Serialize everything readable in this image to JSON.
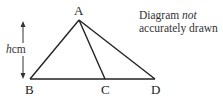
{
  "diagram": {
    "points": {
      "A": {
        "label": "A",
        "x": 79,
        "y": 20
      },
      "B": {
        "label": "B",
        "x": 30,
        "y": 79
      },
      "C": {
        "label": "C",
        "x": 105,
        "y": 79
      },
      "D": {
        "label": "D",
        "x": 155,
        "y": 79
      }
    },
    "segments": [
      "AB",
      "AC",
      "AD",
      "BD"
    ],
    "height_indicator": {
      "variable": "h",
      "unit": "cm"
    },
    "note": {
      "line1_prefix": "Diagram ",
      "line1_emph": "not",
      "line2": "accurately drawn"
    },
    "colors": {
      "stroke": "#222222",
      "text": "#333333"
    }
  }
}
